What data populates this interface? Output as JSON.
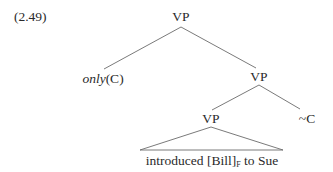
{
  "example_number": "(2.49)",
  "tree": {
    "root": {
      "label": "VP"
    },
    "left_child": {
      "operator": "only",
      "argument": "(C)"
    },
    "right_child": {
      "label": "VP"
    },
    "inner_vp": {
      "label": "VP"
    },
    "squiggle": {
      "label": "~C"
    },
    "leaf": {
      "pre": "introduced [Bill]",
      "subscript": "F",
      "post": " to Sue"
    }
  },
  "colors": {
    "line": "#6b6b6b",
    "text": "#2a2a2a"
  }
}
